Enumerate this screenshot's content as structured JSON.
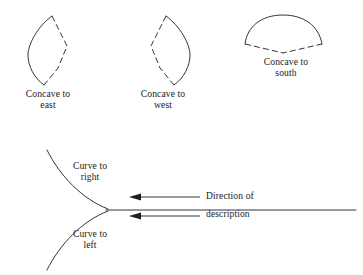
{
  "figure": {
    "line_color": "#1d1d1d",
    "background_color": "#ffffff"
  },
  "shapes": [
    {
      "id": "concave-east",
      "caption": "Concave to\neast",
      "solid_side": "west",
      "dashed_side": "east",
      "description": "Lens shape with solid convex arc on the west side and dashed angular polyline on the east side"
    },
    {
      "id": "concave-west",
      "caption": "Concave to\nwest",
      "solid_side": "east",
      "dashed_side": "west",
      "description": "Lens shape with solid convex arc on the east side and dashed angular polyline on the west side"
    },
    {
      "id": "concave-south",
      "caption": "Concave to\nsouth",
      "solid_side": "north",
      "dashed_side": "south",
      "description": "Fan shape with solid convex arc on top and dashed shallow V on the bottom"
    }
  ],
  "cusp_diagram": {
    "labels": {
      "curve_to_right": "Curve to\nright",
      "curve_to_left": "Curve to\nleft",
      "direction_of": "Direction of",
      "description": "description"
    },
    "arrows": [
      {
        "id": "arrow-direction-of",
        "points_to": "left",
        "label": "Direction of"
      },
      {
        "id": "arrow-description",
        "points_to": "left",
        "label": "description"
      }
    ],
    "baseline_label": "horizontal reference line extending to the right from the cusp"
  }
}
